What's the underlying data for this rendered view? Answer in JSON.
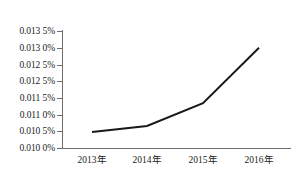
{
  "chart_data": {
    "type": "line",
    "title": "",
    "subtitle": "",
    "xlabel": "",
    "ylabel": "",
    "categories": [
      "2013年",
      "2014年",
      "2015年",
      "2016年"
    ],
    "series": [
      {
        "name": "",
        "values": [
          0.01048,
          0.01066,
          0.01134,
          0.013
        ]
      }
    ],
    "ylim": [
      0.01,
      0.0135
    ],
    "ytick_values": [
      0.0135,
      0.013,
      0.0125,
      0.012,
      0.0115,
      0.011,
      0.0105,
      0.01
    ],
    "ytick_labels": [
      "0.013 5%",
      "0.013 0%",
      "0.012 5%",
      "0.012 5%",
      "0.011 5%",
      "0.011 0%",
      "0.010 5%",
      "0.010 0%"
    ],
    "xtick_labels": [
      "2013年",
      "2014年",
      "2015年",
      "2016年"
    ],
    "grid": false,
    "legend": false,
    "legend_position": "none",
    "markers": false,
    "annotations": [],
    "colors": {
      "series_line": "#1a1a1a",
      "axis": "#6d6d6d",
      "text": "#1c1c1c",
      "background": "#ffffff"
    }
  }
}
